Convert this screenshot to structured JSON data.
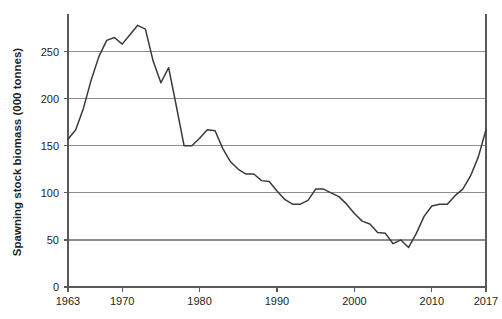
{
  "chart_data": {
    "type": "line",
    "title": "",
    "xlabel": "",
    "ylabel": "Spawning stock biomass (000 tonnes)",
    "xlim": [
      1963,
      2017
    ],
    "ylim": [
      0,
      290
    ],
    "grid": true,
    "legend_position": "none",
    "y_ticks": [
      0,
      50,
      100,
      150,
      200,
      250
    ],
    "y_tick_labels": [
      "0",
      "50",
      "100",
      "150",
      "200",
      "250"
    ],
    "x_ticks": [
      1963,
      1970,
      1980,
      1990,
      2000,
      2010,
      2017
    ],
    "x_tick_labels": [
      "1963",
      "1970",
      "1980",
      "1990",
      "2000",
      "2010",
      "2017"
    ],
    "series": [
      {
        "name": "Spawning stock biomass",
        "color": "#3a3a3a",
        "x": [
          1963,
          1964,
          1965,
          1966,
          1967,
          1968,
          1969,
          1970,
          1971,
          1972,
          1973,
          1974,
          1975,
          1976,
          1977,
          1978,
          1979,
          1980,
          1981,
          1982,
          1983,
          1984,
          1985,
          1986,
          1987,
          1988,
          1989,
          1990,
          1991,
          1992,
          1993,
          1994,
          1995,
          1996,
          1997,
          1998,
          1999,
          2000,
          2001,
          2002,
          2003,
          2004,
          2005,
          2006,
          2007,
          2008,
          2009,
          2010,
          2011,
          2012,
          2013,
          2014,
          2015,
          2016,
          2017
        ],
        "values": [
          157,
          167,
          190,
          220,
          245,
          262,
          265,
          258,
          268,
          278,
          274,
          240,
          217,
          233,
          192,
          150,
          150,
          158,
          167,
          166,
          147,
          133,
          125,
          120,
          120,
          113,
          112,
          102,
          93,
          88,
          88,
          92,
          104,
          104,
          100,
          96,
          88,
          78,
          70,
          67,
          58,
          57,
          46,
          50,
          42,
          57,
          75,
          86,
          88,
          88,
          97,
          104,
          118,
          138,
          167
        ]
      }
    ]
  },
  "axes": {
    "y_title": "Spawning stock biomass (000 tonnes)"
  }
}
